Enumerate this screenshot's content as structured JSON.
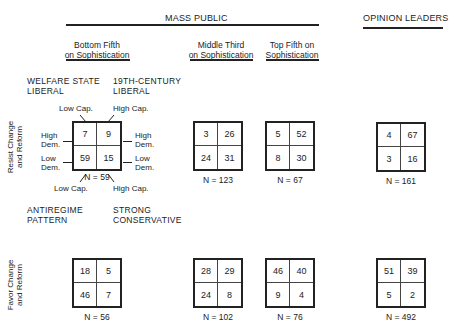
{
  "headers": {
    "mass_public": "MASS PUBLIC",
    "opinion_leaders": "OPINION LEADERS",
    "groups": [
      {
        "line1": "Bottom Fifth",
        "line2": "on Sophistication"
      },
      {
        "line1": "Middle Third",
        "line2": "on Sophistication"
      },
      {
        "line1": "Top Fifth on",
        "line2": "Sophistication"
      }
    ]
  },
  "quadrant_labels": {
    "top_left": {
      "line1": "WELFARE STATE",
      "line2": "LIBERAL"
    },
    "top_right": {
      "line1": "19TH-CENTURY",
      "line2": "LIBERAL"
    },
    "bottom_left": {
      "line1": "ANTIREGIME",
      "line2": "PATTERN"
    },
    "bottom_right": {
      "line1": "STRONG",
      "line2": "CONSERVATIVE"
    }
  },
  "axis_labels": {
    "low_cap": "Low Cap.",
    "high_cap": "High Cap.",
    "high_dem_1": "High",
    "high_dem_2": "Dem.",
    "low_dem_1": "Low",
    "low_dem_2": "Dem."
  },
  "rows": [
    {
      "label_line1": "Resist Change",
      "label_line2": "and Reform",
      "tables": [
        {
          "cells": [
            "7",
            "9",
            "59",
            "15"
          ],
          "n": "N = 59"
        },
        {
          "cells": [
            "3",
            "26",
            "24",
            "31"
          ],
          "n": "N = 123"
        },
        {
          "cells": [
            "5",
            "52",
            "8",
            "30"
          ],
          "n": "N = 67"
        },
        {
          "cells": [
            "4",
            "67",
            "3",
            "16"
          ],
          "n": "N = 161"
        }
      ]
    },
    {
      "label_line1": "Favor Change",
      "label_line2": "and Reform",
      "tables": [
        {
          "cells": [
            "18",
            "5",
            "46",
            "7"
          ],
          "n": "N = 56"
        },
        {
          "cells": [
            "28",
            "29",
            "24",
            "8"
          ],
          "n": "N = 102"
        },
        {
          "cells": [
            "46",
            "40",
            "9",
            "4"
          ],
          "n": "N = 76"
        },
        {
          "cells": [
            "51",
            "39",
            "5",
            "2"
          ],
          "n": "N = 492"
        }
      ]
    }
  ]
}
